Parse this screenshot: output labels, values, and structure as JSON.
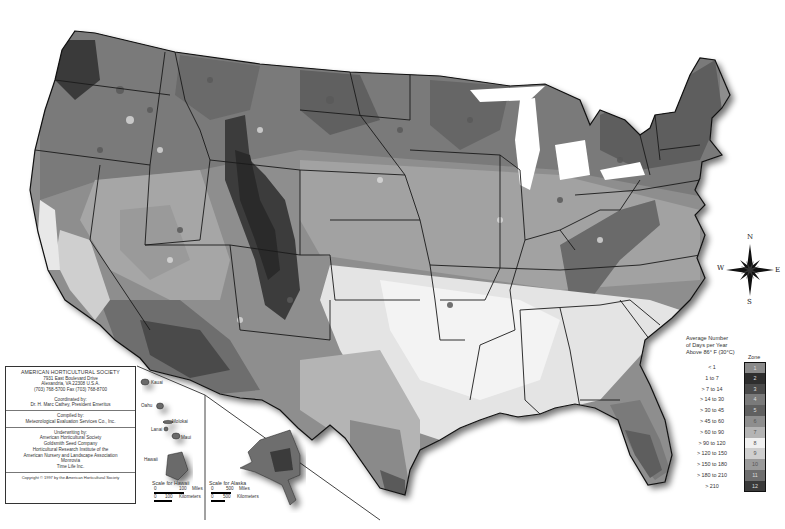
{
  "map": {
    "title": "Plant Heat Zone Map",
    "region": "Contiguous United States with Alaska and Hawaii insets"
  },
  "credits": {
    "org": "AMERICAN HORTICULTURAL SOCIETY",
    "address1": "7931 East Boulevard Drive",
    "address2": "Alexandria, VA 22308 U.S.A.",
    "phone": "(703) 768-5700 Fax (703) 768-8700",
    "coordinated_label": "Coordinated by:",
    "coordinated_by": "Dr. H. Marc Cathey, President Emeritus",
    "compiled_label": "Compiled by:",
    "compiled_by": "Meteorological Evaluation Services Co., Inc.",
    "underwriting_label": "Underwriting by:",
    "underwriters": [
      "American Horticultural Society",
      "Goldsmith Seed Company",
      "Horticultural Research Institute of the",
      "American Nursery and Landscape Association",
      "Monrovia",
      "Time Life Inc."
    ],
    "copyright": "Copyright © 1997 by the American Horticultural Society"
  },
  "hawaii_inset": {
    "islands": [
      "Kauai",
      "Oahu",
      "Molokai",
      "Lanai",
      "Maui",
      "Hawaii"
    ],
    "scale_title": "Scale for Hawaii",
    "scale_miles": [
      "0",
      "100",
      "Miles"
    ],
    "scale_km": [
      "0",
      "100",
      "Kilometers"
    ]
  },
  "alaska_inset": {
    "scale_title": "Scale for Alaska",
    "scale_miles": [
      "0",
      "500",
      "Miles"
    ],
    "scale_km": [
      "0",
      "500",
      "Kilometers"
    ]
  },
  "compass": {
    "n": "N",
    "s": "S",
    "e": "E",
    "w": "W"
  },
  "legend": {
    "title": "Average Number of Days per Year Above 86° F (30°C)",
    "title_lines": [
      "Average Number",
      "of Days per Year",
      "Above 86° F (30°C)"
    ],
    "zone_header": "Zone",
    "zones": [
      {
        "zone": "1",
        "range": "< 1",
        "color": "#8a8a8a"
      },
      {
        "zone": "2",
        "range": "1 to 7",
        "color": "#2e2e2e"
      },
      {
        "zone": "3",
        "range": "> 7 to 14",
        "color": "#4a4a4a"
      },
      {
        "zone": "4",
        "range": "> 14 to 30",
        "color": "#7a7a7a"
      },
      {
        "zone": "5",
        "range": "> 30 to 45",
        "color": "#606060"
      },
      {
        "zone": "6",
        "range": "> 45 to 60",
        "color": "#8e8e8e"
      },
      {
        "zone": "7",
        "range": "> 60 to 90",
        "color": "#b4b4b4"
      },
      {
        "zone": "8",
        "range": "> 90 to 120",
        "color": "#f0f0f0"
      },
      {
        "zone": "9",
        "range": "> 120 to 150",
        "color": "#cfcfcf"
      },
      {
        "zone": "10",
        "range": "> 150 to 180",
        "color": "#9a9a9a"
      },
      {
        "zone": "11",
        "range": "> 180 to 210",
        "color": "#6e6e6e"
      },
      {
        "zone": "12",
        "range": "> 210",
        "color": "#3a3a3a"
      }
    ]
  }
}
